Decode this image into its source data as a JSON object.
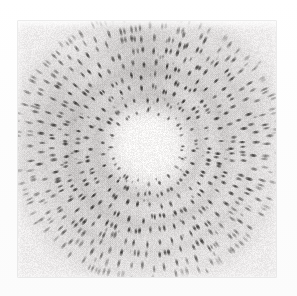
{
  "image": {
    "kind": "x-ray-diffraction-photograph",
    "description": "Scanned black-and-white X-ray diffraction photograph showing concentric rings of dark elongated spots around a bright central disc",
    "width_px": 297,
    "height_px": 296,
    "background_color": "#fcfcfc"
  },
  "photo": {
    "left_px": 18,
    "top_px": 21,
    "width_px": 258,
    "height_px": 256,
    "base_tone": "#eceaea",
    "border_color": "#aaa8a8"
  },
  "pattern": {
    "center_x_px": 130,
    "center_y_px": 126,
    "central_disc_radius_px": 29,
    "central_disc_tone": "#f4f3f2",
    "spot_color": "#2a2826",
    "diffuse_halo_color": "#b9b6b4",
    "spot_count": 470,
    "spot_elongation": "radial",
    "symmetry_fold": 6,
    "ring_radii_px": [
      36,
      48,
      60,
      72,
      84,
      96,
      108,
      120,
      132
    ],
    "halo_bands": [
      {
        "radius_px": 52,
        "width_px": 15,
        "strength": 0.26
      },
      {
        "radius_px": 78,
        "width_px": 18,
        "strength": 0.3
      },
      {
        "radius_px": 104,
        "width_px": 20,
        "strength": 0.22
      },
      {
        "radius_px": 130,
        "width_px": 20,
        "strength": 0.12
      }
    ],
    "grain_amount": 0.09,
    "vignette_strength": 0.16
  },
  "chart_data": {
    "type": "scatter",
    "title": "",
    "xlabel": "",
    "ylabel": "",
    "x": [
      0,
      10,
      20,
      29,
      36,
      42,
      48,
      54,
      60,
      66,
      72,
      78,
      84,
      90,
      96,
      104,
      112,
      120,
      130,
      140
    ],
    "values": [
      0.96,
      0.96,
      0.95,
      0.94,
      0.88,
      0.84,
      0.79,
      0.8,
      0.76,
      0.74,
      0.72,
      0.7,
      0.73,
      0.76,
      0.78,
      0.8,
      0.83,
      0.86,
      0.89,
      0.92
    ],
    "xlim": [
      0,
      140
    ],
    "ylim": [
      0,
      1
    ],
    "grid": false,
    "legend": "none"
  }
}
